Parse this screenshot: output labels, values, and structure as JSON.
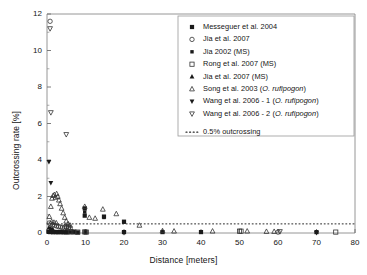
{
  "chart_data": {
    "type": "scatter",
    "title": "",
    "xlabel": "Distance [meters]",
    "ylabel": "Outcrossing rate [%]",
    "xlim": [
      0,
      80
    ],
    "ylim": [
      0,
      12
    ],
    "xticks": [
      0,
      10,
      20,
      30,
      40,
      50,
      60,
      70,
      80
    ],
    "yticks": [
      0,
      2,
      4,
      6,
      8,
      10,
      12
    ],
    "grid": false,
    "legend_position": "upper right",
    "series": [
      {
        "name": "Messeguer et al. 2004",
        "marker": "square-filled",
        "points": [
          [
            0.4,
            0.06
          ],
          [
            0.8,
            0.05
          ],
          [
            1.2,
            0.07
          ],
          [
            1.6,
            0.04
          ],
          [
            2.0,
            0.06
          ],
          [
            2.4,
            0.05
          ],
          [
            2.8,
            0.04
          ],
          [
            3.2,
            0.06
          ],
          [
            3.6,
            0.05
          ],
          [
            4.0,
            0.04
          ],
          [
            4.5,
            0.05
          ],
          [
            5.0,
            0.03
          ],
          [
            5.5,
            0.05
          ],
          [
            6.0,
            0.04
          ],
          [
            7.0,
            0.05
          ],
          [
            8.0,
            0.03
          ],
          [
            9.8,
            1.35
          ],
          [
            9.8,
            0.95
          ],
          [
            10.0,
            0.05
          ],
          [
            14.8,
            0.9
          ],
          [
            20.0,
            0.62
          ],
          [
            20.0,
            0.05
          ],
          [
            30.0,
            0.05
          ],
          [
            40.0,
            0.05
          ],
          [
            70.0,
            0.05
          ]
        ]
      },
      {
        "name": "Jia et al. 2007",
        "marker": "circle-open",
        "points": [
          [
            0.8,
            11.6
          ],
          [
            0.6,
            0.55
          ],
          [
            1.0,
            0.5
          ],
          [
            1.5,
            0.45
          ],
          [
            2.0,
            0.42
          ],
          [
            2.5,
            0.38
          ],
          [
            3.0,
            0.35
          ],
          [
            3.5,
            0.33
          ],
          [
            4.0,
            0.3
          ],
          [
            4.5,
            0.28
          ],
          [
            5.0,
            0.3
          ],
          [
            5.5,
            0.27
          ],
          [
            6.0,
            0.26
          ],
          [
            60.0,
            0.05
          ]
        ]
      },
      {
        "name": "Jia 2002 (MS)",
        "marker": "square-filled-small",
        "points": [
          [
            9.8,
            1.15
          ],
          [
            10.0,
            0.04
          ],
          [
            14.8,
            0.85
          ],
          [
            20.0,
            0.6
          ]
        ]
      },
      {
        "name": "Rong et al. 2007 (MS)",
        "marker": "square-open",
        "points": [
          [
            5.0,
            0.35
          ],
          [
            5.6,
            0.32
          ],
          [
            6.2,
            0.08
          ],
          [
            7.0,
            0.06
          ],
          [
            8.0,
            0.05
          ],
          [
            9.8,
            0.06
          ],
          [
            10.2,
            0.05
          ],
          [
            50.0,
            0.1
          ],
          [
            50.4,
            0.1
          ],
          [
            75.0,
            0.05
          ]
        ]
      },
      {
        "name": "Jia et al. 2007 (MS)",
        "marker": "triangle-up-filled",
        "points": [
          [
            0.5,
            0.3
          ],
          [
            1.0,
            0.25
          ],
          [
            1.5,
            0.22
          ]
        ]
      },
      {
        "name": "Song et al. 2003 (O. rufipogon)",
        "marker": "triangle-up-open",
        "points": [
          [
            0.6,
            0.9
          ],
          [
            1.0,
            1.45
          ],
          [
            1.3,
            1.9
          ],
          [
            1.6,
            2.05
          ],
          [
            1.9,
            2.1
          ],
          [
            2.2,
            1.95
          ],
          [
            2.5,
            2.15
          ],
          [
            2.8,
            2.0
          ],
          [
            3.1,
            1.8
          ],
          [
            3.4,
            1.6
          ],
          [
            3.8,
            1.35
          ],
          [
            4.2,
            1.1
          ],
          [
            4.6,
            0.85
          ],
          [
            5.0,
            0.65
          ],
          [
            5.5,
            0.5
          ],
          [
            6.0,
            0.42
          ],
          [
            1.2,
            0.62
          ],
          [
            1.8,
            0.58
          ],
          [
            2.4,
            0.55
          ],
          [
            9.8,
            1.45
          ],
          [
            11.0,
            0.85
          ],
          [
            12.5,
            0.8
          ],
          [
            14.5,
            1.3
          ],
          [
            18.0,
            1.05
          ],
          [
            24.0,
            0.42
          ],
          [
            30.0,
            0.12
          ],
          [
            33.0,
            0.1
          ],
          [
            43.0,
            0.1
          ],
          [
            52.0,
            0.1
          ],
          [
            57.0,
            0.08
          ],
          [
            59.0,
            0.08
          ]
        ]
      },
      {
        "name": "Wang et al. 2006 - 1 (O. rufipogon)",
        "marker": "triangle-down-filled",
        "points": [
          [
            0.5,
            3.9
          ],
          [
            1.0,
            2.75
          ],
          [
            20.0,
            0.0
          ],
          [
            70.0,
            0.0
          ]
        ]
      },
      {
        "name": "Wang et al. 2006 - 2 (O. rufipogon)",
        "marker": "triangle-down-open",
        "points": [
          [
            0.8,
            11.2
          ],
          [
            1.0,
            6.6
          ],
          [
            5.0,
            5.4
          ],
          [
            60.5,
            0.08
          ]
        ]
      }
    ],
    "reference_line": {
      "label": "0.5% outcrossing",
      "value": 0.5,
      "style": "dotted"
    }
  },
  "legend": {
    "entries": [
      "Messeguer et al. 2004",
      "Jia et al. 2007",
      "Jia 2002 (MS)",
      "Rong et al. 2007 (MS)",
      "Jia et al. 2007 (MS)",
      "Song et al. 2003 (O. rufipogon)",
      "Wang et al. 2006 - 1 (O. rufipogon)",
      "Wang et al. 2006 - 2 (O. rufipogon)",
      "0.5% outcrossing"
    ]
  },
  "colors": {
    "marker": "#1a1a1a",
    "axis": "#6e6e6e",
    "text": "#141414"
  }
}
